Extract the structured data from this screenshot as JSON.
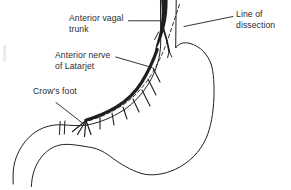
{
  "colors": {
    "ink": "#1f1f1f",
    "text": "#2b2b2b",
    "background": "#ffffff"
  },
  "labels": [
    {
      "id": "anterior-vagal-trunk",
      "lines": [
        "Anterior vagal",
        "trunk"
      ]
    },
    {
      "id": "anterior-nerve-of-latarjet",
      "lines": [
        "Anterior nerve",
        "of Latarjet"
      ]
    },
    {
      "id": "crows-foot",
      "lines": [
        "Crow's foot"
      ]
    },
    {
      "id": "line-of-dissection",
      "lines": [
        "Line of",
        "dissection"
      ]
    }
  ]
}
